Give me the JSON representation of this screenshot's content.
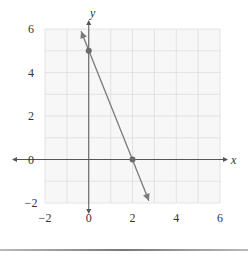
{
  "chart_data": {
    "type": "line",
    "title": "",
    "xlabel": "x",
    "ylabel": "y",
    "xlim": [
      -2,
      6
    ],
    "ylim": [
      -2,
      6
    ],
    "grid": true,
    "grid_step": 1,
    "x_ticks": [
      -2,
      0,
      2,
      4,
      6
    ],
    "y_ticks": [
      -2,
      0,
      2,
      4,
      6
    ],
    "x_tick_labels": [
      "−2",
      "0",
      "2",
      "4",
      "6"
    ],
    "y_tick_labels": [
      "−2",
      "0",
      "2",
      "4",
      "6"
    ],
    "series": [
      {
        "name": "line",
        "x": [
          -0.35,
          2.75
        ],
        "y": [
          5.9,
          -1.9
        ],
        "arrows": "both",
        "points": [
          {
            "x": 0,
            "y": 5
          },
          {
            "x": 2,
            "y": 0
          }
        ]
      }
    ],
    "colors": {
      "line": "#7a7a7a",
      "point": "#6b6b6b",
      "axis": "#555555",
      "grid": "#dddddd",
      "plot_bg": "#f7f7f7"
    }
  }
}
